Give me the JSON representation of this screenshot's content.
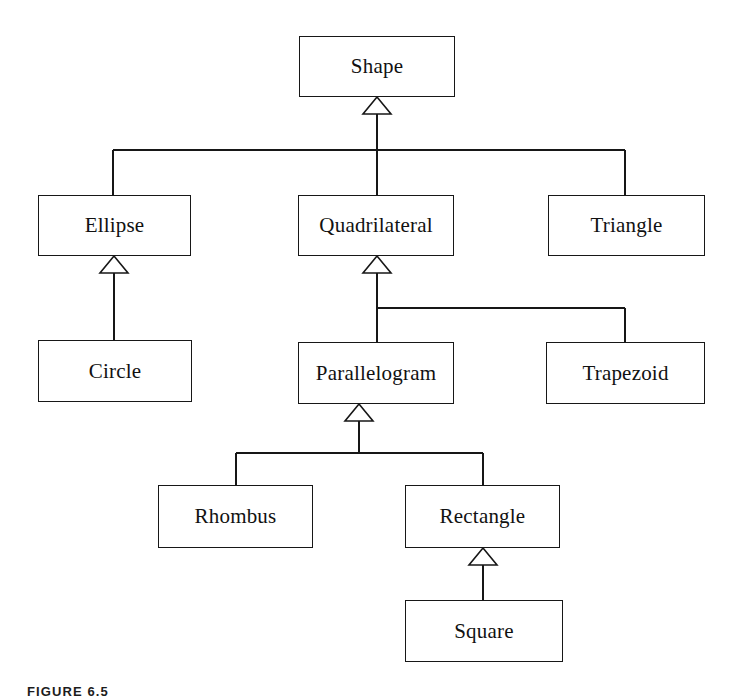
{
  "figure": {
    "caption": "FIGURE 6.5",
    "background_color": "#ffffff",
    "line_color": "#171717",
    "text_color": "#111111"
  },
  "diagram": {
    "type": "uml-class-diagram",
    "relationship": "generalization",
    "arrowhead": "hollow-triangle",
    "classes": [
      {
        "id": "shape",
        "label": "Shape",
        "x": 299,
        "y": 36,
        "w": 156,
        "h": 61,
        "level": 0
      },
      {
        "id": "ellipse",
        "label": "Ellipse",
        "x": 38,
        "y": 195,
        "w": 153,
        "h": 61,
        "level": 1
      },
      {
        "id": "quadrilateral",
        "label": "Quadrilateral",
        "x": 298,
        "y": 195,
        "w": 156,
        "h": 61,
        "level": 1
      },
      {
        "id": "triangle",
        "label": "Triangle",
        "x": 548,
        "y": 195,
        "w": 157,
        "h": 61,
        "level": 1
      },
      {
        "id": "circle",
        "label": "Circle",
        "x": 38,
        "y": 340,
        "w": 154,
        "h": 62,
        "level": 2
      },
      {
        "id": "parallelogram",
        "label": "Parallelogram",
        "x": 298,
        "y": 342,
        "w": 156,
        "h": 62,
        "level": 2
      },
      {
        "id": "trapezoid",
        "label": "Trapezoid",
        "x": 546,
        "y": 342,
        "w": 159,
        "h": 62,
        "level": 2
      },
      {
        "id": "rhombus",
        "label": "Rhombus",
        "x": 158,
        "y": 485,
        "w": 155,
        "h": 63,
        "level": 3
      },
      {
        "id": "rectangle",
        "label": "Rectangle",
        "x": 405,
        "y": 485,
        "w": 155,
        "h": 63,
        "level": 3
      },
      {
        "id": "square",
        "label": "Square",
        "x": 405,
        "y": 600,
        "w": 158,
        "h": 62,
        "level": 4
      }
    ],
    "generalizations": [
      {
        "child": "ellipse",
        "parent": "shape"
      },
      {
        "child": "quadrilateral",
        "parent": "shape"
      },
      {
        "child": "triangle",
        "parent": "shape"
      },
      {
        "child": "circle",
        "parent": "ellipse"
      },
      {
        "child": "parallelogram",
        "parent": "quadrilateral"
      },
      {
        "child": "trapezoid",
        "parent": "quadrilateral"
      },
      {
        "child": "rhombus",
        "parent": "parallelogram"
      },
      {
        "child": "rectangle",
        "parent": "parallelogram"
      },
      {
        "child": "square",
        "parent": "rectangle"
      }
    ]
  }
}
